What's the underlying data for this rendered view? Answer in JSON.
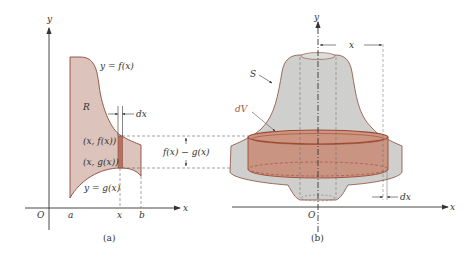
{
  "panel_a": {
    "caption": "(a)",
    "axis_x_label": "x",
    "axis_y_label": "y",
    "origin_label": "O",
    "tick_a": "a",
    "tick_x": "x",
    "tick_b": "b",
    "curve_f_label": "y = f(x)",
    "curve_g_label": "y = g(x)",
    "region_label": "R",
    "dx_label": "dx",
    "point_f_label": "(x, f(x))",
    "point_g_label": "(x, g(x))",
    "height_label": "f(x) − g(x)"
  },
  "panel_b": {
    "caption": "(b)",
    "axis_x_label": "x",
    "axis_y_label": "y",
    "origin_label": "O",
    "solid_label": "S",
    "volume_element_label": "dV",
    "radius_label": "x",
    "dx_label": "dx"
  },
  "colors": {
    "region_fill": "#dcc3bb",
    "region_stroke": "#8a4a3a",
    "strip_fill": "#b87060",
    "solid_fill": "#cfd0ce",
    "shell_fill": "#c98a74",
    "shell_stroke": "#9c4a32",
    "axis": "#333333",
    "dashed": "#666666"
  }
}
